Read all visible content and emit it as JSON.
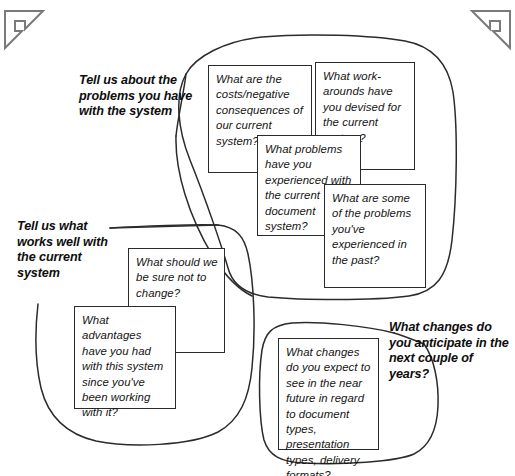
{
  "diagram": {
    "background_color": "#ffffff",
    "ink_color": "#2b2b2b",
    "corners": {
      "top_left_icon": "corner-bracket-icon",
      "top_right_icon": "corner-bracket-icon"
    }
  },
  "clusters": [
    {
      "id": "problems",
      "heading": "Tell us about the problems you have with the system",
      "cards": [
        {
          "id": "costs",
          "text": "What are the costs/negative consequences of our current system?"
        },
        {
          "id": "workarounds",
          "text": "What work-arounds have you devised for the current system?"
        },
        {
          "id": "doc-problems",
          "text": "What problems have you experienced with the current document system?"
        },
        {
          "id": "past-problems",
          "text": "What are some of the problems you've experienced in the past?"
        }
      ]
    },
    {
      "id": "works-well",
      "heading": "Tell us what works well with the current system",
      "cards": [
        {
          "id": "not-change",
          "text": "What should we be sure not to change?"
        },
        {
          "id": "advantages",
          "text": "What advantages have you had with this system since you've been working with it?"
        }
      ]
    },
    {
      "id": "changes",
      "heading": "What changes do you anticipate in the next couple of years?",
      "cards": [
        {
          "id": "near-future",
          "text": "What changes do you expect to see in the near future in regard to document types, presentation types, delivery formats?"
        }
      ]
    }
  ]
}
